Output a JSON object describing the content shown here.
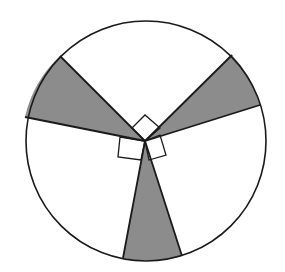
{
  "diagram": {
    "type": "circle-sectors",
    "colors": {
      "stroke": "#1a1a1a",
      "shade": "#8c8c8c",
      "background": "#ffffff"
    },
    "circle": {
      "cx": 146,
      "cy": 141,
      "r": 120
    },
    "center": {
      "x": 145,
      "y": 141
    },
    "shaded_sectors": [
      {
        "name": "upper-left",
        "points": "145,141 60,56 25,117",
        "arc": "M 60 56 A 120 120 0 0 0 25 117"
      },
      {
        "name": "upper-right",
        "points": "145,141 232,55 260,105",
        "arc": "M 232 55 A 120 120 0 0 1 260 105"
      },
      {
        "name": "bottom",
        "points": "145,141 123,258 182,256",
        "arc": "M 182 256 A 120 120 0 0 1 123 258"
      }
    ],
    "right_angle_markers": [
      {
        "name": "top",
        "points": "145,141 132,128 145,115 160,128"
      },
      {
        "name": "left",
        "points": "145,141 120,137 118,157 141,160"
      },
      {
        "name": "right",
        "points": "145,141 149,160 166,155 160,135"
      }
    ]
  }
}
